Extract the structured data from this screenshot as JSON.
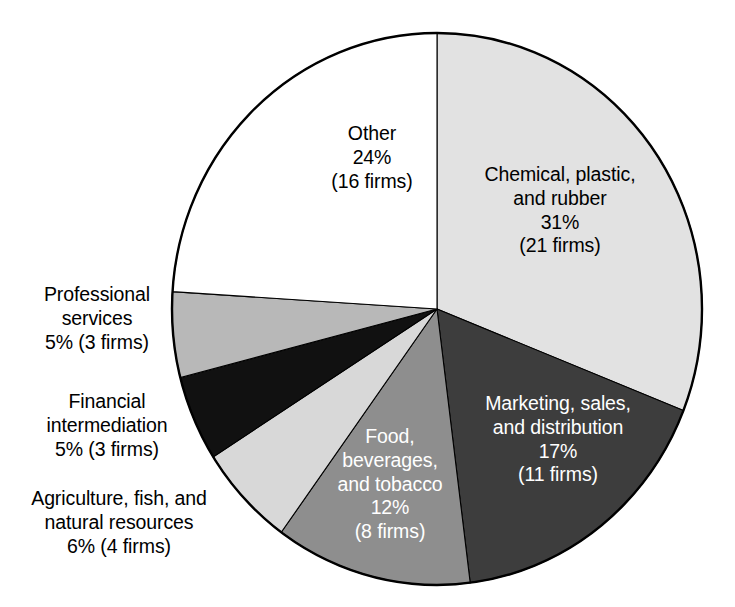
{
  "chart_data": {
    "type": "pie",
    "title": "",
    "subtitle": "",
    "xlabel": "",
    "ylabel": "",
    "legend": "none",
    "grid": false,
    "units": "percent of firms",
    "total_firms": 66,
    "start_angle_deg": 0,
    "direction": "clockwise",
    "categories": [
      "Chemical, plastic, and rubber",
      "Marketing, sales, and distribution",
      "Food, beverages, and tobacco",
      "Agriculture, fish, and natural resources",
      "Financial intermediation",
      "Professional services",
      "Other"
    ],
    "values": [
      31,
      17,
      12,
      6,
      5,
      5,
      24
    ],
    "counts": [
      21,
      11,
      8,
      4,
      3,
      3,
      16
    ],
    "slices": [
      {
        "name": "Chemical, plastic, and rubber",
        "label_lines": "Chemical, plastic,\nand rubber\n31%\n(21 firms)",
        "percent": 31,
        "percent_text": "31%",
        "firms": 21,
        "firms_text": "(21 firms)",
        "color": "#e2e2e2",
        "label_color": "#000000",
        "label_position": "inside",
        "start_deg": 0,
        "end_deg": 111.6
      },
      {
        "name": "Marketing, sales, and distribution",
        "label_lines": "Marketing, sales,\nand distribution\n17%\n(11 firms)",
        "percent": 17,
        "percent_text": "17%",
        "firms": 11,
        "firms_text": "(11 firms)",
        "color": "#3d3d3d",
        "label_color": "#ffffff",
        "label_position": "inside",
        "start_deg": 111.6,
        "end_deg": 172.8
      },
      {
        "name": "Food, beverages, and tobacco",
        "label_lines": "Food,\nbeverages,\nand tobacco\n12%\n(8 firms)",
        "percent": 12,
        "percent_text": "12%",
        "firms": 8,
        "firms_text": "(8 firms)",
        "color": "#8e8e8e",
        "label_color": "#ffffff",
        "label_position": "inside",
        "start_deg": 172.8,
        "end_deg": 216.0
      },
      {
        "name": "Agriculture, fish, and natural resources",
        "label_lines": "Agriculture, fish, and\nnatural resources\n6% (4 firms)",
        "percent": 6,
        "percent_text": "6%",
        "firms": 4,
        "firms_text": "(4 firms)",
        "color": "#d8d8d8",
        "label_color": "#000000",
        "label_position": "outside",
        "start_deg": 216.0,
        "end_deg": 237.6
      },
      {
        "name": "Financial intermediation",
        "label_lines": "Financial\nintermediation\n5% (3 firms)",
        "percent": 5,
        "percent_text": "5%",
        "firms": 3,
        "firms_text": "(3 firms)",
        "color": "#111111",
        "label_color": "#000000",
        "label_position": "outside",
        "start_deg": 237.6,
        "end_deg": 255.6
      },
      {
        "name": "Professional services",
        "label_lines": "Professional\nservices\n5% (3 firms)",
        "percent": 5,
        "percent_text": "5%",
        "firms": 3,
        "firms_text": "(3 firms)",
        "color": "#b8b8b8",
        "label_color": "#000000",
        "label_position": "outside",
        "start_deg": 255.6,
        "end_deg": 273.6
      },
      {
        "name": "Other",
        "label_lines": "Other\n24%\n(16 firms)",
        "percent": 24,
        "percent_text": "24%",
        "firms": 16,
        "firms_text": "(16 firms)",
        "color": "#ffffff",
        "label_color": "#000000",
        "label_position": "inside",
        "start_deg": 273.6,
        "end_deg": 360.0
      }
    ]
  },
  "labels": {
    "chemical": "Chemical, plastic,\nand rubber\n31%\n(21 firms)",
    "other": "Other\n24%\n(16 firms)",
    "marketing": "Marketing, sales,\nand distribution\n17%\n(11 firms)",
    "food": "Food,\nbeverages,\nand tobacco\n12%\n(8 firms)",
    "professional": "Professional\nservices\n5% (3 firms)",
    "financial": "Financial\nintermediation\n5% (3 firms)",
    "agriculture": "Agriculture, fish, and\nnatural resources\n6% (4 firms)"
  },
  "colors": {
    "outline": "#000000",
    "background": "#ffffff",
    "chemical": "#e2e2e2",
    "marketing": "#3d3d3d",
    "food": "#8e8e8e",
    "agriculture": "#d8d8d8",
    "financial": "#111111",
    "professional": "#b8b8b8",
    "other": "#ffffff"
  }
}
